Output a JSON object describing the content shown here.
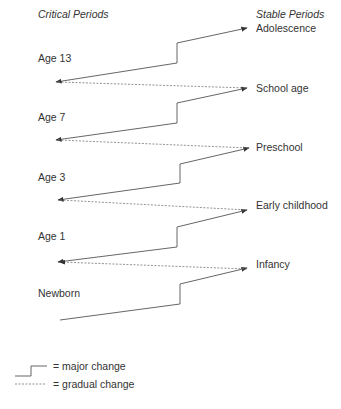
{
  "headers": {
    "left": "Critical Periods",
    "right": "Stable Periods"
  },
  "critical_periods": [
    "Age 13",
    "Age 7",
    "Age 3",
    "Age 1",
    "Newborn"
  ],
  "stable_periods": [
    "Adolescence",
    "School age",
    "Preschool",
    "Early childhood",
    "Infancy"
  ],
  "legend": {
    "major": "= major change",
    "gradual": "= gradual change"
  },
  "colors": {
    "line": "#555555",
    "text": "#333333"
  }
}
